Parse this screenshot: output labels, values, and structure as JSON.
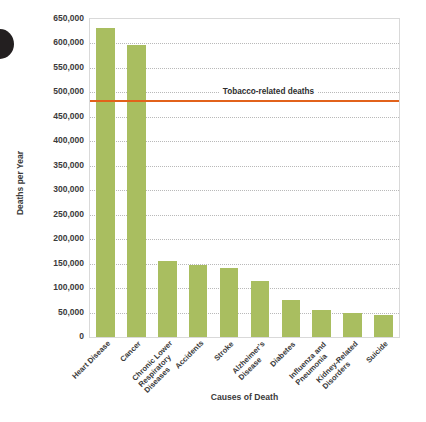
{
  "chart_data": {
    "type": "bar",
    "title": "",
    "xlabel": "Causes of Death",
    "ylabel": "Deaths per Year",
    "categories": [
      "Heart Disease",
      "Cancer",
      "Chronic Lower\nRespiratory\nDiseases",
      "Accidents",
      "Stroke",
      "Alzheimer's\nDisease",
      "Diabetes",
      "Influenza and\nPneumonia",
      "Kidney-Related\nDisorders",
      "Suicide"
    ],
    "values": [
      632000,
      596000,
      155000,
      147000,
      142000,
      115000,
      76000,
      55000,
      49000,
      45000
    ],
    "ylim": [
      0,
      650000
    ],
    "yticks": [
      0,
      50000,
      100000,
      150000,
      200000,
      250000,
      300000,
      350000,
      400000,
      450000,
      500000,
      550000,
      600000,
      650000
    ],
    "ytick_labels": [
      "0",
      "50,000",
      "100,000",
      "150,000",
      "200,000",
      "250,000",
      "300,000",
      "350,000",
      "400,000",
      "450,000",
      "500,000",
      "550,000",
      "600,000",
      "650,000"
    ],
    "grid": true,
    "legend": "none",
    "bar_color": "#a9be60",
    "annotations": [
      {
        "name": "tobacco-threshold",
        "label": "Tobacco-related deaths",
        "value": 483000,
        "color": "#e2621b",
        "type": "hline"
      }
    ]
  }
}
